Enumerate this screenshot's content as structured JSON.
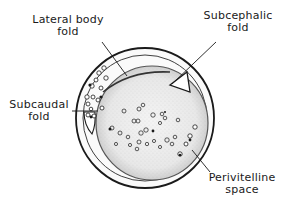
{
  "diagram": {
    "type": "embryo cross-section illustration",
    "colors": {
      "outline": "#1a1a1a",
      "background": "#ffffff",
      "yolk_stipple": "#d9d9d9"
    },
    "labels": {
      "lateral_body_fold": {
        "line1": "Lateral body",
        "line2": "fold"
      },
      "subcephalic_fold": {
        "line1": "Subcephalic",
        "line2": "fold"
      },
      "subcaudal_fold": {
        "line1": "Subcaudal",
        "line2": "fold"
      },
      "perivitelline_space": {
        "line1": "Perivitelline",
        "line2": "space"
      }
    }
  }
}
